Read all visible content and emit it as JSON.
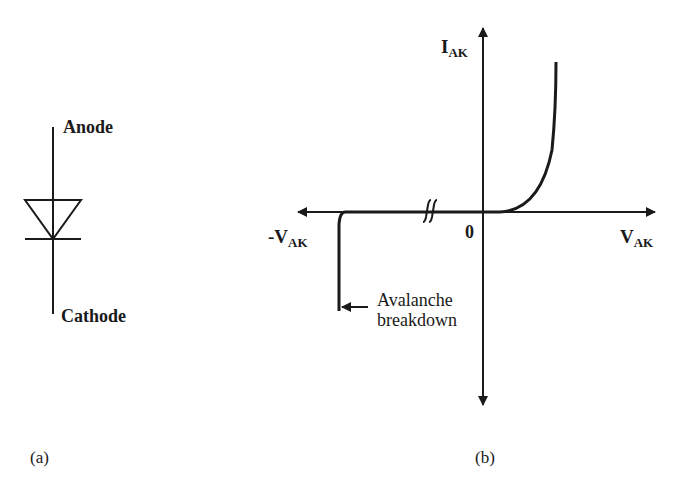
{
  "panel_a": {
    "caption": "(a)",
    "anode_label": "Anode",
    "cathode_label": "Cathode"
  },
  "panel_b": {
    "caption": "(b)",
    "y_axis_label_main": "I",
    "y_axis_label_sub": "AK",
    "x_axis_pos_label_main": "V",
    "x_axis_pos_label_sub": "AK",
    "x_axis_neg_label_main": "-V",
    "x_axis_neg_label_sub": "AK",
    "origin_label": "0",
    "annotation_line1": "Avalanche",
    "annotation_line2": "breakdown"
  },
  "colors": {
    "stroke": "#1a1a1a",
    "background": "#ffffff"
  }
}
